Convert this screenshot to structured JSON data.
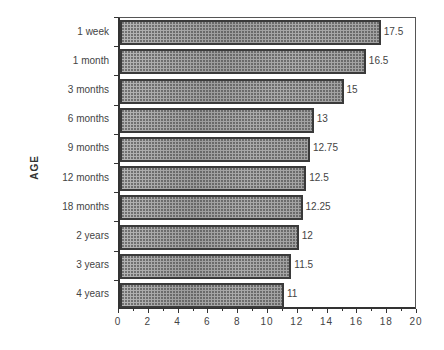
{
  "chart_data": {
    "type": "bar",
    "orientation": "horizontal",
    "title": "",
    "xlabel": "",
    "ylabel": "AGE",
    "categories": [
      "1 week",
      "1 month",
      "3 months",
      "6 months",
      "9 months",
      "12 months",
      "18 months",
      "2 years",
      "3 years",
      "4 years"
    ],
    "values": [
      17.5,
      16.5,
      15,
      13,
      12.75,
      12.5,
      12.25,
      12,
      11.5,
      11
    ],
    "value_labels": [
      "17.5",
      "16.5",
      "15",
      "13",
      "12.75",
      "12.5",
      "12.25",
      "12",
      "11.5",
      "11"
    ],
    "xlim": [
      0,
      20
    ],
    "x_ticks": [
      "0",
      "2",
      "4",
      "6",
      "8",
      "10",
      "12",
      "14",
      "16",
      "18",
      "20"
    ],
    "grid": false,
    "legend": null
  }
}
